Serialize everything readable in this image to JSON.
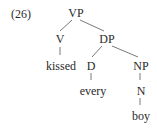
{
  "example_number": "(26)",
  "tree": {
    "root": "VP",
    "nodes": {
      "vp": "VP",
      "v": "V",
      "kissed": "kissed",
      "dp": "DP",
      "d": "D",
      "every": "every",
      "np": "NP",
      "n": "N",
      "boy": "boy"
    },
    "edges": [
      [
        "VP",
        "V"
      ],
      [
        "VP",
        "DP"
      ],
      [
        "V",
        "kissed"
      ],
      [
        "DP",
        "D"
      ],
      [
        "DP",
        "NP"
      ],
      [
        "D",
        "every"
      ],
      [
        "NP",
        "N"
      ],
      [
        "N",
        "boy"
      ]
    ]
  },
  "colors": {
    "text": "#2a2a2a",
    "lines": "#6a6a6a",
    "background": "#ffffff"
  }
}
